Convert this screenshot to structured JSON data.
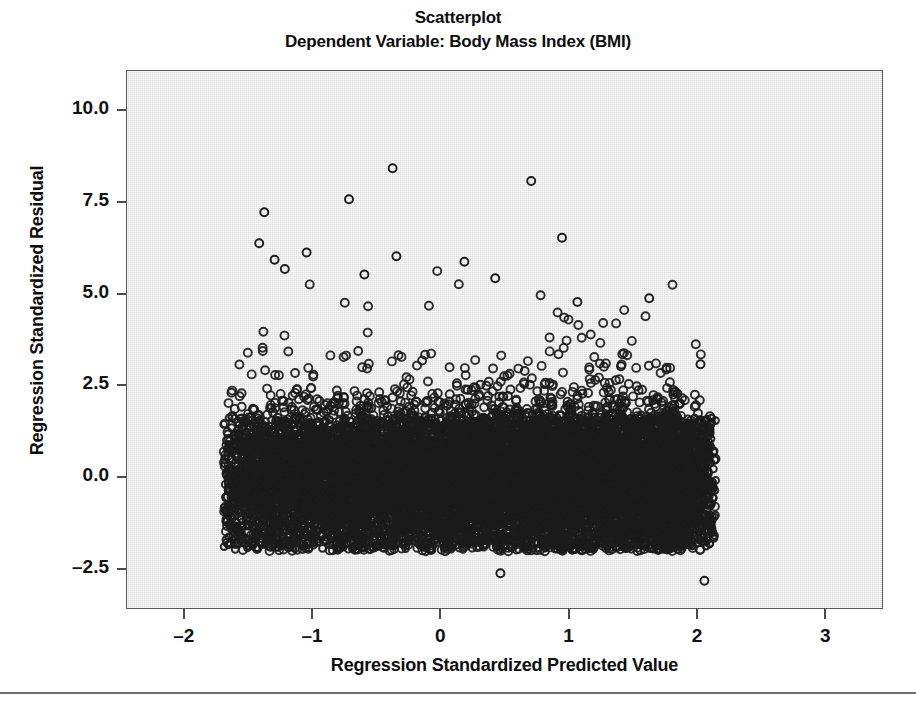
{
  "chart_data": {
    "type": "scatter",
    "title": "Scatterplot",
    "subtitle": "Dependent Variable: Body Mass Index (BMI)",
    "xlabel": "Regression Standardized Predicted Value",
    "ylabel": "Regression Standardized Residual",
    "xlim": [
      -2.45,
      3.45
    ],
    "ylim": [
      -3.6,
      11.1
    ],
    "xticks": [
      -2,
      -1,
      0,
      1,
      2,
      3
    ],
    "xticklabels": [
      "–2",
      "–1",
      "0",
      "1",
      "2",
      "3"
    ],
    "yticks": [
      10.0,
      7.5,
      5.0,
      2.5,
      0.0,
      -2.5
    ],
    "yticklabels": [
      "10.0",
      "7.5",
      "5.0",
      "2.5",
      "0.0",
      "–2.5"
    ],
    "grid": false,
    "legend": null,
    "marker": "open-circle",
    "marker_size_px": 8,
    "marker_color": "#1b1b1b",
    "panel_background": "#ececec",
    "panel_border_color": "#59595b",
    "n_points_approx": 9000,
    "data_extent": {
      "x_min": -1.7,
      "x_max": 2.14,
      "y_min": -2.85,
      "y_max": 8.45,
      "dense_core_y": [
        -2.0,
        2.0
      ],
      "note": "Dense saturated cloud bounded below by a hard floor near -2.0 with a sharp right-hand cutoff at x = 2.14; sparse positive outliers fan upward to 8.45."
    },
    "outliers": [
      {
        "x": -0.38,
        "y": 8.45
      },
      {
        "x": 0.7,
        "y": 8.1
      },
      {
        "x": -0.72,
        "y": 7.6
      },
      {
        "x": -1.38,
        "y": 7.25
      },
      {
        "x": 0.94,
        "y": 6.55
      },
      {
        "x": -1.42,
        "y": 6.4
      },
      {
        "x": -1.05,
        "y": 6.15
      },
      {
        "x": -0.35,
        "y": 6.05
      },
      {
        "x": -1.3,
        "y": 5.95
      },
      {
        "x": 0.18,
        "y": 5.9
      },
      {
        "x": -1.22,
        "y": 5.7
      },
      {
        "x": -0.6,
        "y": 5.55
      },
      {
        "x": 0.42,
        "y": 5.45
      },
      {
        "x": 1.62,
        "y": 4.9
      },
      {
        "x": 1.06,
        "y": 4.8
      },
      {
        "x": 2.02,
        "y": 3.1
      },
      {
        "x": 1.4,
        "y": 3.05
      },
      {
        "x": 1.84,
        "y": 2.3
      },
      {
        "x": 0.46,
        "y": -2.6
      },
      {
        "x": 2.05,
        "y": -2.8
      }
    ]
  }
}
